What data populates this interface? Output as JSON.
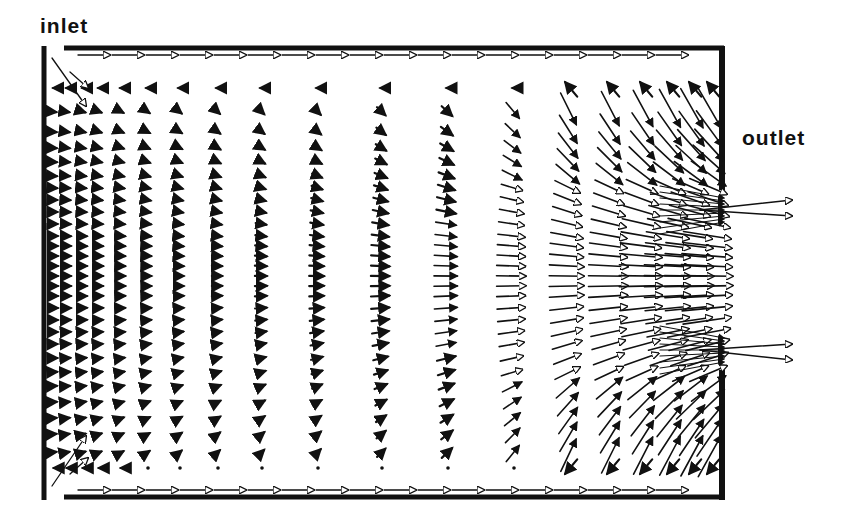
{
  "labels": {
    "inlet": "inlet",
    "outlet": "outlet"
  },
  "colors": {
    "ink": "#111111",
    "background": "#ffffff"
  },
  "geometry": {
    "left_wall_x": 44,
    "right_wall_x": 722,
    "top_wall_y": 48,
    "bottom_wall_y": 497,
    "inlet_top_y": [
      48,
      108
    ],
    "inlet_bottom_y": [
      430,
      497
    ],
    "outlet_y": [
      188,
      372
    ]
  },
  "field": {
    "columns_x": [
      55,
      68,
      84,
      100,
      122,
      148,
      180,
      218,
      262,
      318,
      382,
      448,
      514,
      570,
      612,
      645,
      672,
      694,
      712
    ],
    "rows_y": [
      88,
      112,
      132,
      148,
      162,
      176,
      188,
      200,
      212,
      224,
      236,
      246,
      256,
      266,
      276,
      286,
      296,
      308,
      320,
      332,
      344,
      358,
      372,
      386,
      402,
      418,
      434,
      452,
      468
    ]
  }
}
